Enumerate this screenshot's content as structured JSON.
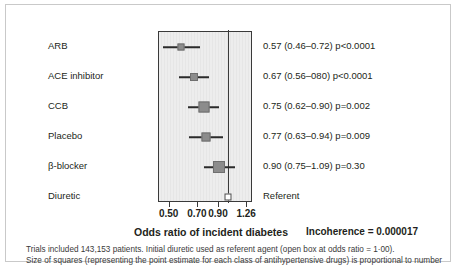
{
  "chart_data": {
    "type": "forest",
    "title": "",
    "xlabel": "Odds ratio of incident diabetes",
    "ylabel": "",
    "xticks": [
      0.5,
      0.7,
      0.9,
      1.26
    ],
    "xticklabels": [
      "0.50",
      "0.70",
      "0.90",
      "1.26"
    ],
    "xlim": [
      0.44,
      1.35
    ],
    "xscale": "log",
    "reference_line": 1.0,
    "grid": false,
    "legend": "none",
    "categories": [
      "ARB",
      "ACE inhibitor",
      "CCB",
      "Placebo",
      "β-blocker",
      "Diuretic"
    ],
    "values": [
      0.57,
      0.67,
      0.75,
      0.77,
      0.9,
      1.0
    ],
    "ci_low": [
      0.46,
      0.56,
      0.62,
      0.63,
      0.75,
      null
    ],
    "ci_high": [
      0.72,
      0.8,
      0.9,
      0.94,
      1.09,
      null
    ],
    "p_values": [
      "p<0.0001",
      "p<0.0001",
      "p=0.002",
      "p=0.009",
      "p=0.30",
      ""
    ],
    "marker_weights": [
      7,
      8,
      11,
      9,
      12,
      7
    ],
    "rows": [
      {
        "label": "ARB",
        "estimate": 0.57,
        "low": 0.46,
        "high": 0.72,
        "stat": "0.57 (0.46–0.72) p<0.0001",
        "weight": 7,
        "open": false
      },
      {
        "label": "ACE inhibitor",
        "estimate": 0.67,
        "low": 0.56,
        "high": 0.8,
        "stat": "0.67 (0.56–080) p<0.0001",
        "weight": 8,
        "open": false
      },
      {
        "label": "CCB",
        "estimate": 0.75,
        "low": 0.62,
        "high": 0.9,
        "stat": "0.75 (0.62–0.90) p=0.002",
        "weight": 11,
        "open": false
      },
      {
        "label": "Placebo",
        "estimate": 0.77,
        "low": 0.63,
        "high": 0.94,
        "stat": "0.77 (0.63–0.94) p=0.009",
        "weight": 9,
        "open": false
      },
      {
        "label": "β-blocker",
        "estimate": 0.9,
        "low": 0.75,
        "high": 1.09,
        "stat": "0.90 (0.75–1.09) p=0.30",
        "weight": 12,
        "open": false
      },
      {
        "label": "Diuretic",
        "estimate": 1.0,
        "low": null,
        "high": null,
        "stat": "Referent",
        "weight": 7,
        "open": true
      }
    ],
    "annotations": {
      "incoherence_label": "Incoherence = 0.000017"
    },
    "colors": {
      "marker_fill": "#8c8c8c",
      "marker_edge": "#6f6f6f",
      "open_marker_fill": "#ffffff",
      "plot_background": "#ededed",
      "axis": "#3a3a3a",
      "text": "#231f20"
    }
  },
  "footnote": {
    "line1": "Trials included 143,153 patients. Initial diuretic used as referent agent (open box at odds ratio = 1·00).",
    "line2": "Size of squares (representing the point estimate for each class of antihypertensive drugs) is proportional to number"
  }
}
